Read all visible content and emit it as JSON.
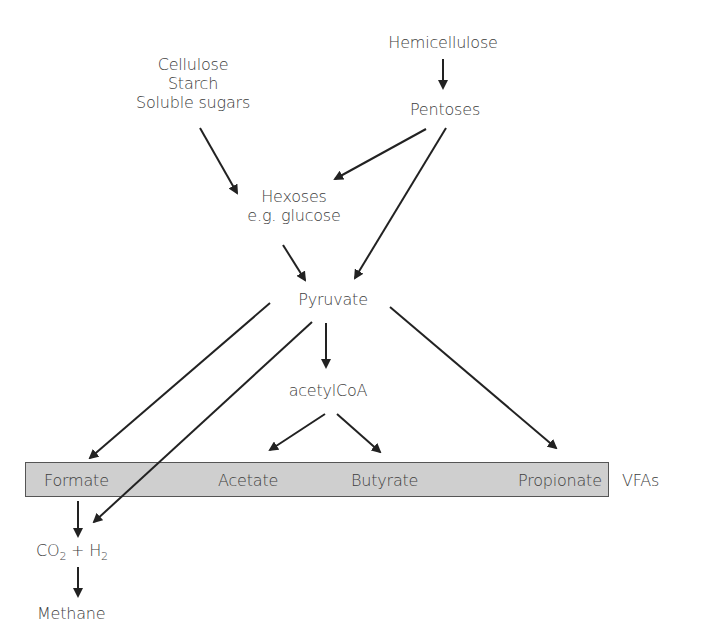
{
  "diagram": {
    "nodes": {
      "polysaccharides": [
        "Cellulose",
        "Starch",
        "Soluble sugars"
      ],
      "hemicellulose": "Hemicellulose",
      "pentoses": "Pentoses",
      "hexoses": [
        "Hexoses",
        "e.g. glucose"
      ],
      "pyruvate": "Pyruvate",
      "acetylcoa": "acetylCoA",
      "formate": "Formate",
      "acetate": "Acetate",
      "butyrate": "Butyrate",
      "propionate": "Propionate",
      "vfas": "VFAs",
      "co2": "CO",
      "co2_sub": "2",
      "plus": " + H",
      "h2_sub": "2",
      "methane": "Methane"
    },
    "edges": [
      [
        "Cellulose/Starch/Soluble sugars",
        "Hexoses"
      ],
      [
        "Hemicellulose",
        "Pentoses"
      ],
      [
        "Pentoses",
        "Hexoses"
      ],
      [
        "Pentoses",
        "Pyruvate"
      ],
      [
        "Hexoses",
        "Pyruvate"
      ],
      [
        "Pyruvate",
        "Formate"
      ],
      [
        "Pyruvate",
        "CO2 + H2"
      ],
      [
        "Pyruvate",
        "acetylCoA"
      ],
      [
        "Pyruvate",
        "Propionate"
      ],
      [
        "acetylCoA",
        "Acetate"
      ],
      [
        "acetylCoA",
        "Butyrate"
      ],
      [
        "Formate",
        "CO2 + H2"
      ],
      [
        "CO2 + H2",
        "Methane"
      ]
    ],
    "colors": {
      "bar_fill": "#cfcfcf",
      "arrow": "#222222",
      "text": "#404040"
    }
  }
}
